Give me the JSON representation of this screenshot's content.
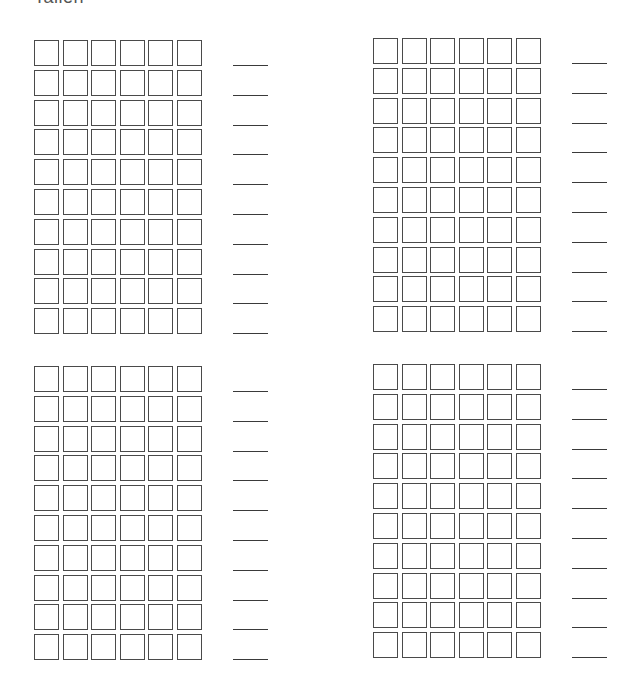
{
  "header": {
    "title": "Tallen"
  },
  "worksheet": {
    "box_color": "#4a4a4a",
    "line_color": "#3a3a3a",
    "columns_per_row": 6,
    "rows_per_block": 10,
    "blocks": [
      {
        "id": "top-left",
        "position": "top-left",
        "rows": 10,
        "boxes_per_row": 6,
        "answer_lines": 10
      },
      {
        "id": "top-right",
        "position": "top-right",
        "rows": 10,
        "boxes_per_row": 6,
        "answer_lines": 10
      },
      {
        "id": "bottom-left",
        "position": "bottom-left",
        "rows": 10,
        "boxes_per_row": 6,
        "answer_lines": 10
      },
      {
        "id": "bottom-right",
        "position": "bottom-right",
        "rows": 10,
        "boxes_per_row": 6,
        "answer_lines": 10
      }
    ]
  }
}
